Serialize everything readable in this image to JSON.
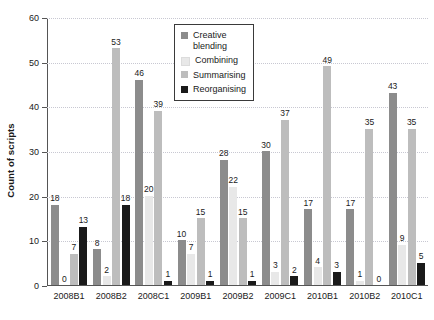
{
  "chart_data": {
    "type": "bar",
    "title": "",
    "xlabel": "",
    "ylabel": "Count of scripts",
    "ylim": [
      0,
      60
    ],
    "ytick_step": 10,
    "ytick_labels": [
      "0",
      "10",
      "20",
      "30",
      "40",
      "50",
      "60"
    ],
    "grid": true,
    "legend_position": "top-center-inside",
    "categories": [
      "2008B1",
      "2008B2",
      "2008C1",
      "2009B1",
      "2009B2",
      "2009C1",
      "2010B1",
      "2010B2",
      "2010C1"
    ],
    "series": [
      {
        "name": "Creative blending",
        "color": "#8c8c8c",
        "values": [
          18,
          8,
          46,
          10,
          28,
          30,
          17,
          17,
          43
        ]
      },
      {
        "name": "Combining",
        "color": "#e8e8e8",
        "values": [
          0,
          2,
          20,
          7,
          22,
          3,
          4,
          1,
          9
        ]
      },
      {
        "name": "Summarising",
        "color": "#bdbdbd",
        "values": [
          7,
          53,
          39,
          15,
          15,
          37,
          49,
          35,
          35
        ]
      },
      {
        "name": "Reorganising",
        "color": "#1a1a1a",
        "values": [
          13,
          18,
          1,
          1,
          1,
          2,
          3,
          0,
          5
        ]
      }
    ]
  },
  "legend": {
    "items": [
      {
        "label": "Creative\nblending"
      },
      {
        "label": "Combining"
      },
      {
        "label": "Summarising"
      },
      {
        "label": "Reorganising"
      }
    ]
  },
  "colors": {
    "axis": "#555555",
    "grid": "#c8c8d2",
    "text": "#1a1a1a",
    "background": "#ffffff"
  }
}
